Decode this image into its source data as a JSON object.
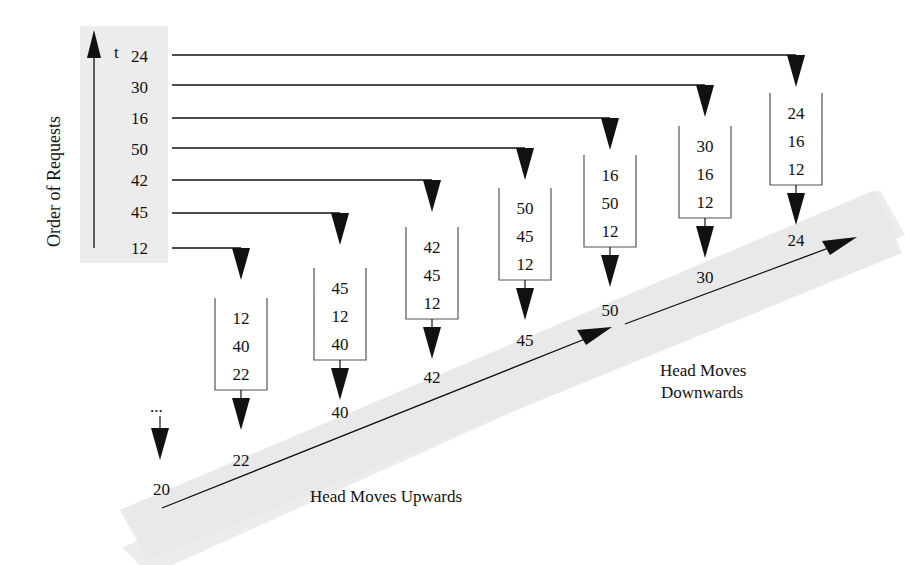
{
  "axis": {
    "label": "Order of Requests",
    "time_label": "t"
  },
  "request_order": [
    "12",
    "45",
    "42",
    "50",
    "16",
    "30",
    "24"
  ],
  "request_order_display_top_to_bottom": [
    "24",
    "30",
    "16",
    "50",
    "42",
    "45",
    "12"
  ],
  "initial": {
    "ellipsis": "...",
    "position": "20"
  },
  "steps": [
    {
      "incoming": "12",
      "queue": [
        "12",
        "40",
        "22"
      ],
      "serviced": "22"
    },
    {
      "incoming": "45",
      "queue": [
        "45",
        "12",
        "40"
      ],
      "serviced": "40"
    },
    {
      "incoming": "42",
      "queue": [
        "42",
        "45",
        "12"
      ],
      "serviced": "42"
    },
    {
      "incoming": "50",
      "queue": [
        "50",
        "45",
        "12"
      ],
      "serviced": "45"
    },
    {
      "incoming": "16",
      "queue": [
        "16",
        "50",
        "12"
      ],
      "serviced": "50"
    },
    {
      "incoming": "30",
      "queue": [
        "30",
        "16",
        "12"
      ],
      "serviced": "30"
    },
    {
      "incoming": "24",
      "queue": [
        "24",
        "16",
        "12"
      ],
      "serviced": "24"
    }
  ],
  "labels": {
    "up": "Head Moves Upwards",
    "down_line1": "Head Moves",
    "down_line2": "Downwards"
  },
  "colors": {
    "band": "#ececec",
    "ink": "#111111"
  }
}
